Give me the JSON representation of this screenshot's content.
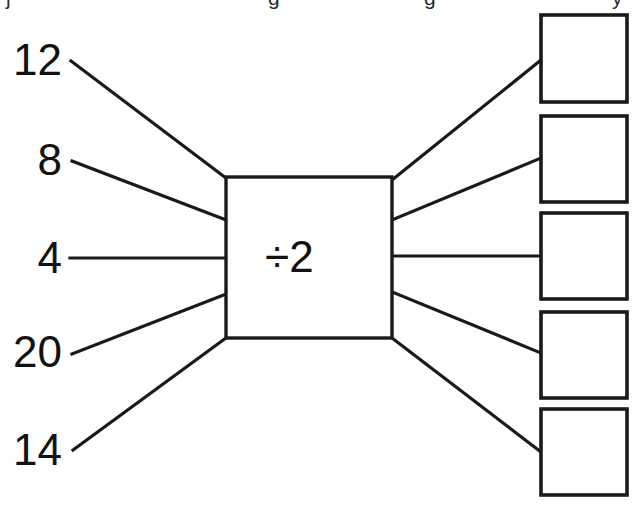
{
  "worksheet": {
    "type": "function-machine",
    "title_fragment_visible": "",
    "operation": "÷2",
    "operation_symbol": "÷",
    "operation_operand": "2",
    "inputs": [
      {
        "value": "12",
        "index": 0
      },
      {
        "value": "8",
        "index": 1
      },
      {
        "value": "4",
        "index": 2
      },
      {
        "value": "20",
        "index": 3
      },
      {
        "value": "14",
        "index": 4
      }
    ],
    "answers": [
      {
        "value": "",
        "index": 0
      },
      {
        "value": "",
        "index": 1
      },
      {
        "value": "",
        "index": 2
      },
      {
        "value": "",
        "index": 3
      },
      {
        "value": "",
        "index": 4
      }
    ],
    "colors": {
      "ink": "#111111",
      "line": "#1a1a1a",
      "paper": "#ffffff"
    },
    "geometry": {
      "machine_box": {
        "x": 226,
        "y": 177,
        "w": 166,
        "h": 161
      },
      "answer_box_size": {
        "w": 86,
        "h": 87
      },
      "answer_box_x": 541,
      "answer_box_y": [
        15,
        116,
        213,
        312,
        409
      ],
      "input_label_x_right": 62,
      "input_label_y": [
        38,
        138,
        236,
        330,
        428
      ]
    }
  }
}
